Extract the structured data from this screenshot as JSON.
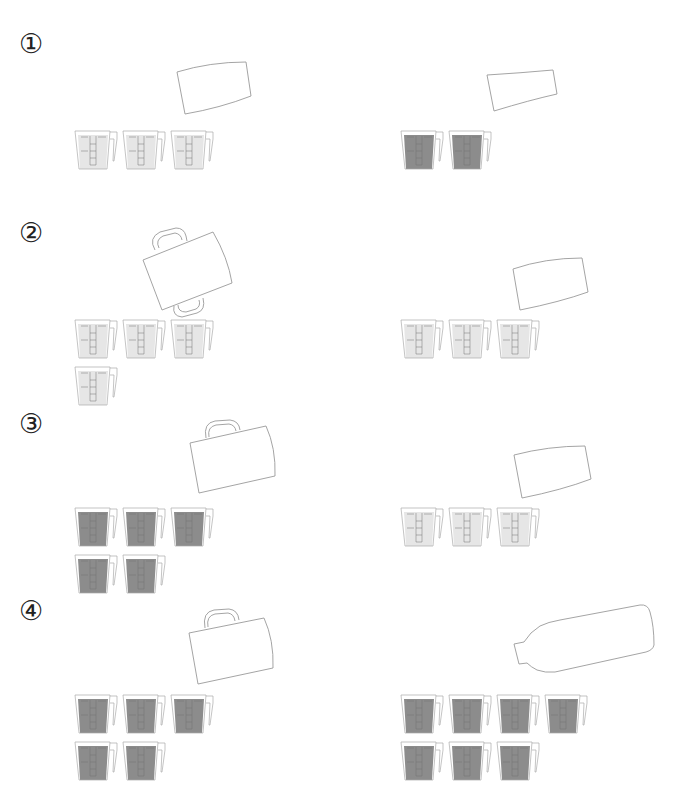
{
  "problems": [
    {
      "label": "①",
      "top": 30,
      "left": {
        "container": "cup",
        "beakers": 3,
        "filled": false
      },
      "right": {
        "container": "cup-small",
        "beakers": 2,
        "filled": true
      }
    },
    {
      "label": "②",
      "top": 222,
      "left": {
        "container": "pot-two-handles",
        "beakers": 4,
        "filled": false
      },
      "right": {
        "container": "cup",
        "beakers": 3,
        "filled": false
      }
    },
    {
      "label": "③",
      "top": 410,
      "left": {
        "container": "pitcher",
        "beakers": 5,
        "filled": true
      },
      "right": {
        "container": "cup",
        "beakers": 3,
        "filled": false
      }
    },
    {
      "label": "④",
      "top": 597,
      "left": {
        "container": "pitcher",
        "beakers": 5,
        "filled": true
      },
      "right": {
        "container": "bottle",
        "beakers": 7,
        "filled": true
      }
    }
  ],
  "colors": {
    "outline": "#9a9a9a",
    "empty_fill": "#e6e6e6",
    "full_fill": "#8c8c8c",
    "mark": "#707070"
  }
}
